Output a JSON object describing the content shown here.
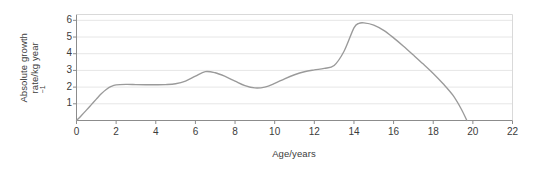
{
  "chart_data": {
    "type": "line",
    "title": "",
    "xlabel": "Age/years",
    "ylabel_line1": "Absolute growth",
    "ylabel_line2_pre": "rate/kg year",
    "ylabel_line2_sup": "−1",
    "ylabel_plain": "Absolute growth rate/kg year−1",
    "xlim": [
      0,
      22
    ],
    "ylim": [
      0,
      6.35
    ],
    "xticks": [
      0,
      2,
      4,
      6,
      8,
      10,
      12,
      14,
      16,
      18,
      20,
      22
    ],
    "xtick_labels": [
      "0",
      "2",
      "4",
      "6",
      "8",
      "10",
      "12",
      "14",
      "16",
      "18",
      "20",
      "22"
    ],
    "yticks": [
      1,
      2,
      3,
      4,
      5,
      6
    ],
    "ytick_labels": [
      "1",
      "2",
      "3",
      "4",
      "5",
      "6"
    ],
    "grid": "horizontal",
    "legend": "none",
    "markers": "none",
    "series": [
      {
        "name": "Absolute growth rate",
        "color": "#9a9a9a",
        "x": [
          0,
          0.25,
          0.5,
          0.75,
          1.0,
          1.25,
          1.5,
          1.75,
          2.0,
          2.5,
          3.0,
          3.5,
          4.0,
          4.5,
          5.0,
          5.5,
          6.0,
          6.5,
          7.0,
          7.5,
          8.0,
          8.5,
          9.0,
          9.5,
          10.0,
          10.5,
          11.0,
          11.5,
          12.0,
          12.5,
          13.0,
          13.5,
          14.0,
          14.25,
          14.5,
          15.0,
          15.5,
          16.0,
          16.5,
          17.0,
          17.5,
          18.0,
          18.5,
          19.0,
          19.4,
          19.7
        ],
        "y": [
          0.0,
          0.3,
          0.62,
          0.95,
          1.28,
          1.6,
          1.86,
          2.04,
          2.13,
          2.16,
          2.15,
          2.14,
          2.14,
          2.15,
          2.2,
          2.36,
          2.66,
          2.93,
          2.86,
          2.64,
          2.36,
          2.09,
          1.95,
          2.0,
          2.22,
          2.5,
          2.74,
          2.92,
          3.03,
          3.12,
          3.3,
          4.15,
          5.55,
          5.82,
          5.85,
          5.72,
          5.4,
          4.95,
          4.45,
          3.92,
          3.38,
          2.82,
          2.2,
          1.5,
          0.72,
          0.0
        ]
      }
    ]
  },
  "axes": {
    "axis_color": "#8c8c8c",
    "grid_color": "#e6e6e6",
    "frame_color": "#d9d9d9",
    "tick_text_color": "#3b3b3b",
    "background": "#ffffff"
  }
}
